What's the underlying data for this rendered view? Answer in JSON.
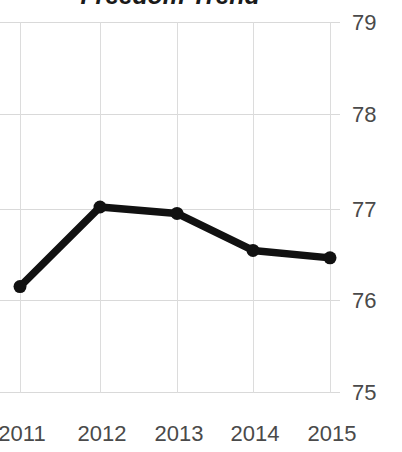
{
  "chart_data": {
    "type": "line",
    "title": "Freedom Trend",
    "xlabel": "",
    "ylabel": "",
    "categories": [
      "2011",
      "2012",
      "2013",
      "2014",
      "2015"
    ],
    "x": [
      2011,
      2012,
      2013,
      2014,
      2015
    ],
    "values": [
      76.14,
      77.0,
      76.93,
      76.53,
      76.45
    ],
    "series": [
      {
        "name": "Freedom Trend",
        "values": [
          76.14,
          77.0,
          76.93,
          76.53,
          76.45
        ]
      }
    ],
    "ylim": [
      75,
      79
    ],
    "yticks": [
      "79",
      "78",
      "77",
      "76",
      "75"
    ],
    "ytick_values": [
      79,
      78,
      77,
      76,
      75
    ],
    "xticks": [
      "2011",
      "2012",
      "2013",
      "2014",
      "2015"
    ],
    "grid": true,
    "legend": false,
    "legend_position": "none",
    "y_axis_side": "right",
    "line_color": "#111111",
    "marker": "circle",
    "marker_color": "#111111",
    "grid_color": "#d9d9d9",
    "background_color": "#ffffff",
    "title_clipped": true,
    "annotations": []
  },
  "axis": {
    "y_labels": [
      "79",
      "78",
      "77",
      "76",
      "75"
    ],
    "x_labels": [
      "2011",
      "2012",
      "2013",
      "2014",
      "2015"
    ]
  }
}
